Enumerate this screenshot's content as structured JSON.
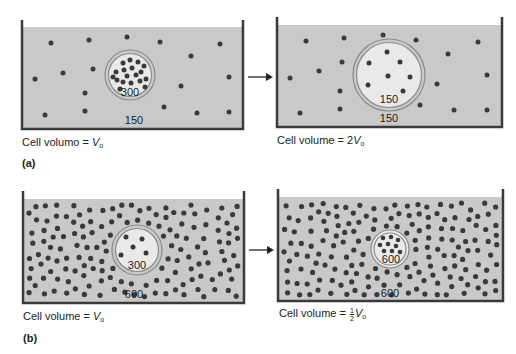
{
  "colors": {
    "solution": "#c9c9c9",
    "cell_interior": "#e9e9e9",
    "particle": "#3a3a3a",
    "wall": "#3a3a3a",
    "membrane": "#8a8a8a"
  },
  "panel_a": {
    "label": "(a)",
    "before": {
      "inside_osmolarity": "300",
      "outside_osmolarity": "150",
      "caption_prefix": "Cell volumo = ",
      "caption_var": "V",
      "caption_sub": "o"
    },
    "after": {
      "inside_osmolarity": "150",
      "outside_osmolarity": "150",
      "caption_prefix": "Cell volume = 2",
      "caption_var": "V",
      "caption_sub": "o"
    }
  },
  "panel_b": {
    "label": "(b)",
    "before": {
      "inside_osmolarity": "300",
      "outside_osmolarity": "600",
      "caption_prefix": "Cell volume = ",
      "caption_var": "V",
      "caption_sub": "o"
    },
    "after": {
      "inside_osmolarity": "600",
      "outside_osmolarity": "600",
      "caption_prefix": "Cell volume = ",
      "caption_frac_num": "1",
      "caption_frac_den": "2",
      "caption_var": "V",
      "caption_sub": "o"
    }
  },
  "icons": {
    "arrow": "right-arrow-icon"
  }
}
